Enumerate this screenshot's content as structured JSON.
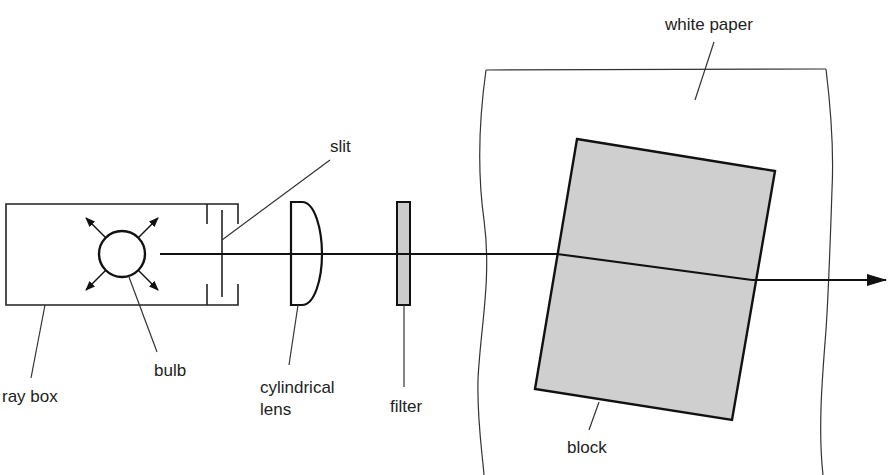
{
  "diagram": {
    "type": "physics apparatus",
    "colors": {
      "ink": "#111111",
      "block_fill": "#cfcfcf",
      "filter_fill": "#cccccc",
      "background": "#ffffff"
    },
    "labels": {
      "white_paper": "white paper",
      "slit": "slit",
      "ray_box": "ray box",
      "bulb": "bulb",
      "cylindrical_lens_line1": "cylindrical",
      "cylindrical_lens_line2": "lens",
      "filter": "filter",
      "block": "block"
    },
    "components": [
      {
        "id": "ray-box",
        "label": "ray box"
      },
      {
        "id": "bulb",
        "label": "bulb"
      },
      {
        "id": "slit",
        "label": "slit"
      },
      {
        "id": "cylindrical-lens",
        "label": "cylindrical lens"
      },
      {
        "id": "filter",
        "label": "filter"
      },
      {
        "id": "white-paper",
        "label": "white paper"
      },
      {
        "id": "block",
        "label": "block"
      }
    ]
  }
}
